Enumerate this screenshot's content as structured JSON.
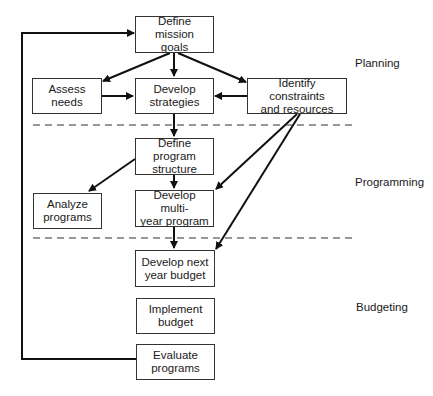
{
  "diagram": {
    "type": "flowchart",
    "phases": [
      {
        "id": "planning",
        "label": "Planning"
      },
      {
        "id": "programming",
        "label": "Programming"
      },
      {
        "id": "budgeting",
        "label": "Budgeting"
      }
    ],
    "nodes": [
      {
        "id": "define-mission-goals",
        "label": "Define mission goals",
        "phase": "planning"
      },
      {
        "id": "assess-needs",
        "label": "Assess needs",
        "phase": "planning"
      },
      {
        "id": "develop-strategies",
        "label": "Develop strategies",
        "phase": "planning"
      },
      {
        "id": "identify-constraints",
        "label": "Identify constraints and resources",
        "phase": "planning"
      },
      {
        "id": "define-program-structure",
        "label": "Define program structure",
        "phase": "programming"
      },
      {
        "id": "analyze-programs",
        "label": "Analyze programs",
        "phase": "programming"
      },
      {
        "id": "develop-multiyear-program",
        "label": "Develop multi-year program",
        "phase": "programming"
      },
      {
        "id": "develop-next-year-budget",
        "label": "Develop next year budget",
        "phase": "budgeting"
      },
      {
        "id": "implement-budget",
        "label": "Implement budget",
        "phase": "budgeting"
      },
      {
        "id": "evaluate-programs",
        "label": "Evaluate programs",
        "phase": "budgeting"
      }
    ],
    "edges": [
      {
        "from": "define-mission-goals",
        "to": "assess-needs"
      },
      {
        "from": "define-mission-goals",
        "to": "develop-strategies"
      },
      {
        "from": "define-mission-goals",
        "to": "identify-constraints"
      },
      {
        "from": "assess-needs",
        "to": "develop-strategies"
      },
      {
        "from": "identify-constraints",
        "to": "develop-strategies"
      },
      {
        "from": "develop-strategies",
        "to": "define-program-structure"
      },
      {
        "from": "define-program-structure",
        "to": "analyze-programs"
      },
      {
        "from": "define-program-structure",
        "to": "develop-multiyear-program"
      },
      {
        "from": "identify-constraints",
        "to": "develop-multiyear-program"
      },
      {
        "from": "identify-constraints",
        "to": "develop-next-year-budget"
      },
      {
        "from": "develop-multiyear-program",
        "to": "develop-next-year-budget"
      },
      {
        "from": "evaluate-programs",
        "to": "define-mission-goals",
        "type": "feedback"
      }
    ]
  },
  "labels": {
    "n1a": "Define mission",
    "n1b": "goals",
    "n2a": "Assess",
    "n2b": "needs",
    "n3a": "Develop",
    "n3b": "strategies",
    "n4a": "Identify constraints",
    "n4b": "and resources",
    "n5a": "Define program",
    "n5b": "structure",
    "n6a": "Analyze",
    "n6b": "programs",
    "n7a": "Develop multi-",
    "n7b": "year program",
    "n8a": "Develop next",
    "n8b": "year budget",
    "n9a": "Implement",
    "n9b": "budget",
    "n10a": "Evaluate",
    "n10b": "programs",
    "planning": "Planning",
    "programming": "Programming",
    "budgeting": "Budgeting"
  }
}
